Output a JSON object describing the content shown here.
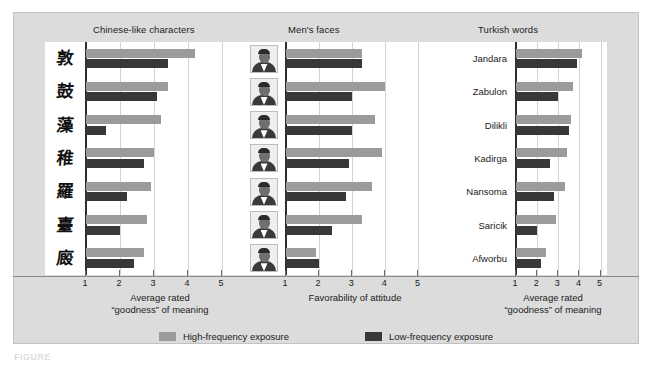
{
  "figure": {
    "caption_label": "FIGURE",
    "legend": [
      {
        "key": "high",
        "label": "High-frequency exposure",
        "color": "#9b9b9b"
      },
      {
        "key": "low",
        "label": "Low-frequency exposure",
        "color": "#383838"
      }
    ]
  },
  "panels": {
    "chinese": {
      "title": "Chinese-like characters",
      "axis_caption_line1": "Average rated",
      "axis_caption_line2": "“goodness” of meaning",
      "ticks": [
        "1",
        "2",
        "3",
        "4",
        "5"
      ],
      "categories": [
        "glyph-1",
        "glyph-2",
        "glyph-3",
        "glyph-4",
        "glyph-5",
        "glyph-6",
        "glyph-7"
      ],
      "glyphs": [
        "敦",
        "鼓",
        "藻",
        "稚",
        "羅",
        "臺",
        "廄"
      ]
    },
    "faces": {
      "title": "Men's faces",
      "axis_caption_line1": "Favorability of attitude",
      "axis_caption_line2": "",
      "ticks": [
        "1",
        "2",
        "3",
        "4",
        "5"
      ],
      "categories": [
        "face-1",
        "face-2",
        "face-3",
        "face-4",
        "face-5",
        "face-6",
        "face-7"
      ]
    },
    "turkish": {
      "title": "Turkish words",
      "axis_caption_line1": "Average rated",
      "axis_caption_line2": "“goodness” of meaning",
      "ticks": [
        "1",
        "2",
        "3",
        "4",
        "5"
      ],
      "categories": [
        "Jandara",
        "Zabulon",
        "Dilikli",
        "Kadirga",
        "Nansoma",
        "Saricik",
        "Afworbu"
      ]
    }
  },
  "chart_data": [
    {
      "type": "bar",
      "title": "Chinese-like characters",
      "orientation": "horizontal",
      "xlabel": "Average rated “goodness” of meaning",
      "ylabel": "",
      "xlim": [
        1,
        5
      ],
      "xticks": [
        1,
        2,
        3,
        4,
        5
      ],
      "grid": true,
      "categories": [
        "character 1",
        "character 2",
        "character 3",
        "character 4",
        "character 5",
        "character 6",
        "character 7"
      ],
      "series": [
        {
          "name": "High-frequency exposure",
          "color": "#9b9b9b",
          "values": [
            4.2,
            3.4,
            3.2,
            3.0,
            2.9,
            2.8,
            2.7
          ]
        },
        {
          "name": "Low-frequency exposure",
          "color": "#383838",
          "values": [
            3.4,
            3.1,
            1.6,
            2.7,
            2.2,
            2.0,
            2.4
          ]
        }
      ]
    },
    {
      "type": "bar",
      "title": "Men's faces",
      "orientation": "horizontal",
      "xlabel": "Favorability of attitude",
      "ylabel": "",
      "xlim": [
        1,
        5
      ],
      "xticks": [
        1,
        2,
        3,
        4,
        5
      ],
      "grid": true,
      "categories": [
        "face 1",
        "face 2",
        "face 3",
        "face 4",
        "face 5",
        "face 6",
        "face 7"
      ],
      "series": [
        {
          "name": "High-frequency exposure",
          "color": "#9b9b9b",
          "values": [
            3.3,
            4.0,
            3.7,
            3.9,
            3.6,
            3.3,
            1.9
          ]
        },
        {
          "name": "Low-frequency exposure",
          "color": "#383838",
          "values": [
            3.3,
            3.0,
            3.0,
            2.9,
            2.8,
            2.4,
            2.0
          ]
        }
      ]
    },
    {
      "type": "bar",
      "title": "Turkish words",
      "orientation": "horizontal",
      "xlabel": "Average rated “goodness” of meaning",
      "ylabel": "",
      "xlim": [
        1,
        5
      ],
      "xticks": [
        1,
        2,
        3,
        4,
        5
      ],
      "grid": true,
      "categories": [
        "Jandara",
        "Zabulon",
        "Dilikli",
        "Kadirga",
        "Nansoma",
        "Saricik",
        "Afworbu"
      ],
      "series": [
        {
          "name": "High-frequency exposure",
          "color": "#9b9b9b",
          "values": [
            4.1,
            3.7,
            3.6,
            3.4,
            3.3,
            2.9,
            2.4
          ]
        },
        {
          "name": "Low-frequency exposure",
          "color": "#383838",
          "values": [
            3.9,
            3.0,
            3.5,
            2.6,
            2.8,
            2.0,
            2.2
          ]
        }
      ]
    }
  ]
}
